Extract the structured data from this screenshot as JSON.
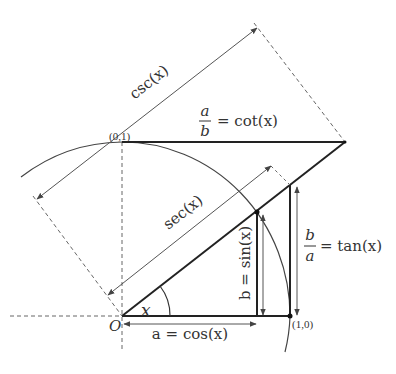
{
  "colors": {
    "line": "#222222",
    "thin": "#555555",
    "dashed": "#666666",
    "text": "#333333",
    "background": "#ffffff"
  },
  "points": {
    "origin": "O",
    "x_axis_unit": "(1,0)",
    "y_axis_unit": "(0,1)"
  },
  "angle_label": "x",
  "labels": {
    "csc": "csc(x)",
    "sec": "sec(x)",
    "cot_num": "a",
    "cot_den": "b",
    "cot_rhs": "= cot(x)",
    "tan_num": "b",
    "tan_den": "a",
    "tan_rhs": "= tan(x)",
    "sin": "b = sin(x)",
    "cos": "a = cos(x)"
  }
}
